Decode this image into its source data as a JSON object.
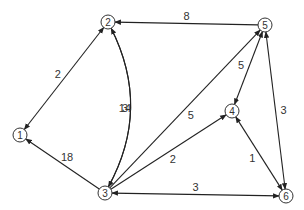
{
  "diagram": {
    "type": "weighted-directed-graph",
    "nodes": [
      {
        "id": "1",
        "label": "1",
        "x": 20,
        "y": 135
      },
      {
        "id": "2",
        "label": "2",
        "x": 108,
        "y": 22
      },
      {
        "id": "3",
        "label": "3",
        "x": 105,
        "y": 193
      },
      {
        "id": "4",
        "label": "4",
        "x": 232,
        "y": 111
      },
      {
        "id": "5",
        "label": "5",
        "x": 265,
        "y": 25
      },
      {
        "id": "6",
        "label": "6",
        "x": 286,
        "y": 196
      }
    ],
    "edges": [
      {
        "from": "2",
        "to": "1",
        "weight": "2",
        "bidirectional": true
      },
      {
        "from": "5",
        "to": "2",
        "weight": "8",
        "bidirectional": false
      },
      {
        "from": "3",
        "to": "2",
        "weight": "14",
        "bidirectional": false,
        "curve": "left"
      },
      {
        "from": "2",
        "to": "3",
        "weight": "3",
        "bidirectional": false,
        "curve": "right"
      },
      {
        "from": "3",
        "to": "1",
        "weight": "18",
        "bidirectional": false
      },
      {
        "from": "3",
        "to": "5",
        "weight": "5",
        "bidirectional": false
      },
      {
        "from": "3",
        "to": "4",
        "weight": "2",
        "bidirectional": false
      },
      {
        "from": "5",
        "to": "4",
        "weight": "5",
        "bidirectional": true
      },
      {
        "from": "6",
        "to": "5",
        "weight": "3",
        "bidirectional": true
      },
      {
        "from": "4",
        "to": "6",
        "weight": "1",
        "bidirectional": true
      },
      {
        "from": "6",
        "to": "3",
        "weight": "3",
        "bidirectional": true
      }
    ]
  }
}
